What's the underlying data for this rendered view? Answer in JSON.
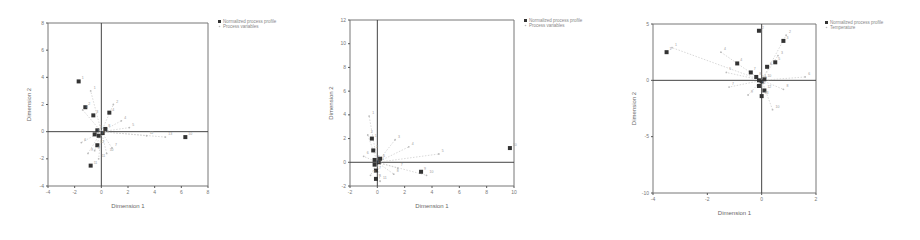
{
  "chart_data": [
    {
      "type": "scatter",
      "title": "",
      "xlabel": "Dimension 1",
      "ylabel": "Dimension 2",
      "xlim": [
        -4,
        8
      ],
      "ylim": [
        -4,
        8
      ],
      "xticks": [
        "-4",
        "-2",
        "0",
        "2",
        "4",
        "6",
        "8"
      ],
      "yticks": [
        "-4",
        "-2",
        "0",
        "2",
        "4",
        "6",
        "8"
      ],
      "grid": false,
      "legend_position": "top-right",
      "legend": [
        "Normalized process profile",
        "Process variables"
      ],
      "series": [
        {
          "name": "Normalized process profile",
          "marker": "square",
          "points": [
            [
              -1.7,
              3.7
            ],
            [
              -1.2,
              1.8
            ],
            [
              -0.6,
              1.2
            ],
            [
              0.6,
              1.4
            ],
            [
              -0.3,
              0.1
            ],
            [
              0.1,
              -0.1
            ],
            [
              -0.2,
              -0.3
            ],
            [
              0.3,
              0.2
            ],
            [
              -0.5,
              -0.2
            ],
            [
              6.3,
              -0.4
            ],
            [
              -0.8,
              -2.5
            ],
            [
              -0.3,
              -1.0
            ]
          ]
        },
        {
          "name": "Process variables",
          "marker": "dot",
          "points": [
            [
              -0.8,
              3.0
            ],
            [
              0.9,
              2.0
            ],
            [
              -1.4,
              1.6
            ],
            [
              1.5,
              0.8
            ],
            [
              2.1,
              0.3
            ],
            [
              -1.5,
              -0.8
            ],
            [
              0.8,
              -1.2
            ],
            [
              -0.5,
              -1.4
            ],
            [
              -1.0,
              -1.6
            ],
            [
              0.4,
              -1.6
            ],
            [
              -0.2,
              -2.0
            ],
            [
              3.4,
              -0.3
            ],
            [
              4.8,
              -0.4
            ]
          ]
        }
      ]
    },
    {
      "type": "scatter",
      "title": "",
      "xlabel": "Dimension 1",
      "ylabel": "Dimension 2",
      "xlim": [
        -2,
        10
      ],
      "ylim": [
        -2,
        12
      ],
      "xticks": [
        "-2",
        "0",
        "2",
        "4",
        "6",
        "8",
        "10"
      ],
      "yticks": [
        "-2",
        "0",
        "2",
        "4",
        "6",
        "8",
        "10",
        "12"
      ],
      "grid": false,
      "legend_position": "top-right",
      "legend": [
        "Normalized process profile",
        "Process variables"
      ],
      "series": [
        {
          "name": "Normalized process profile",
          "marker": "square",
          "points": [
            [
              -0.4,
              2.0
            ],
            [
              -0.3,
              1.0
            ],
            [
              -0.2,
              0.2
            ],
            [
              0.1,
              0.0
            ],
            [
              -0.2,
              -0.2
            ],
            [
              0.2,
              0.3
            ],
            [
              -0.1,
              -0.7
            ],
            [
              -0.1,
              -1.4
            ],
            [
              3.2,
              -0.8
            ],
            [
              9.7,
              1.2
            ]
          ]
        },
        {
          "name": "Process variables",
          "marker": "dot",
          "points": [
            [
              -0.6,
              3.9
            ],
            [
              -0.7,
              2.3
            ],
            [
              1.3,
              1.9
            ],
            [
              2.3,
              1.3
            ],
            [
              4.5,
              0.7
            ],
            [
              -1.0,
              0.5
            ],
            [
              1.5,
              -0.5
            ],
            [
              1.2,
              -1.0
            ],
            [
              -0.5,
              -1.1
            ],
            [
              3.6,
              -1.1
            ],
            [
              0.2,
              -1.6
            ]
          ]
        }
      ]
    },
    {
      "type": "scatter",
      "title": "",
      "xlabel": "Dimension 1",
      "ylabel": "Dimension 2",
      "xlim": [
        -4,
        2
      ],
      "ylim": [
        -10,
        5
      ],
      "xticks": [
        "-4",
        "-2",
        "0",
        "2"
      ],
      "yticks": [
        "-10",
        "-5",
        "0",
        "5"
      ],
      "grid": false,
      "legend_position": "top-right",
      "legend": [
        "Normalized process profile",
        "Temperature"
      ],
      "series": [
        {
          "name": "Normalized process profile",
          "marker": "square",
          "points": [
            [
              -3.5,
              2.5
            ],
            [
              -0.1,
              4.4
            ],
            [
              0.8,
              3.5
            ],
            [
              -0.9,
              1.5
            ],
            [
              0.5,
              1.6
            ],
            [
              0.2,
              1.2
            ],
            [
              -0.4,
              0.7
            ],
            [
              -0.2,
              0.3
            ],
            [
              0.0,
              -0.1
            ],
            [
              0.1,
              0.1
            ],
            [
              -0.1,
              -0.5
            ],
            [
              0.1,
              -0.9
            ],
            [
              0.0,
              -1.4
            ],
            [
              -0.1,
              0.0
            ]
          ]
        },
        {
          "name": "Temperature",
          "marker": "dot",
          "points": [
            [
              -3.3,
              2.9
            ],
            [
              0.9,
              4.0
            ],
            [
              0.6,
              2.2
            ],
            [
              -1.5,
              2.5
            ],
            [
              -1.3,
              0.7
            ],
            [
              1.6,
              0.3
            ],
            [
              -1.2,
              -0.6
            ],
            [
              0.8,
              -0.8
            ],
            [
              -0.5,
              -1.3
            ],
            [
              0.4,
              -2.6
            ]
          ]
        }
      ]
    }
  ]
}
